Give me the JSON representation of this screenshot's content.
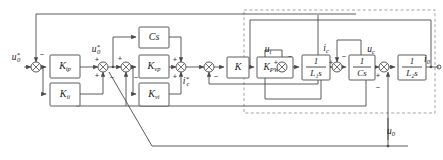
{
  "diagram": {
    "type": "control-block-diagram",
    "colors": {
      "wire": "#4a4a4a",
      "block_stroke": "#4a4a4a",
      "dashed_box": "#9a9a9a",
      "text": "#1a1a1a",
      "background": "#ffffff"
    },
    "blocks": [
      {
        "id": "kip",
        "label": "K",
        "sub": "ip",
        "x": 50,
        "y": 55,
        "w": 30,
        "h": 23
      },
      {
        "id": "kii",
        "label": "K",
        "sub": "ii",
        "x": 50,
        "y": 83,
        "w": 30,
        "h": 23
      },
      {
        "id": "cs",
        "label": "Cs",
        "sub": "",
        "x": 139,
        "y": 27,
        "w": 30,
        "h": 21
      },
      {
        "id": "kvp",
        "label": "K",
        "sub": "vp",
        "x": 139,
        "y": 55,
        "w": 30,
        "h": 23
      },
      {
        "id": "kvi",
        "label": "K",
        "sub": "vi",
        "x": 139,
        "y": 83,
        "w": 30,
        "h": 23
      },
      {
        "id": "k",
        "label": "K",
        "sub": "",
        "x": 227,
        "y": 57,
        "w": 22,
        "h": 21
      },
      {
        "id": "kpwm",
        "label": "K",
        "sub": "PWM",
        "x": 257,
        "y": 57,
        "w": 36,
        "h": 21
      },
      {
        "id": "l1s",
        "label": "1",
        "sub": "L₁s",
        "x": 302,
        "y": 55,
        "w": 28,
        "h": 25
      },
      {
        "id": "cs2",
        "label": "1",
        "sub": "Cs",
        "x": 349,
        "y": 55,
        "w": 26,
        "h": 25
      },
      {
        "id": "l2s",
        "label": "1",
        "sub": "L₂s",
        "x": 398,
        "y": 55,
        "w": 28,
        "h": 25
      }
    ],
    "summing_junctions": [
      {
        "id": "sum1",
        "x": 36,
        "y": 67,
        "signs": [
          {
            "t": "−",
            "x": 41,
            "y": 54
          }
        ]
      },
      {
        "id": "sum2",
        "x": 103,
        "y": 67,
        "signs": [
          {
            "t": "+",
            "x": 97,
            "y": 60
          },
          {
            "t": "+",
            "x": 97,
            "y": 76
          },
          {
            "t": "−",
            "x": 112,
            "y": 78
          }
        ]
      },
      {
        "id": "sum3",
        "x": 126,
        "y": 67,
        "signs": [
          {
            "t": "+",
            "x": 120,
            "y": 59
          },
          {
            "t": "−",
            "x": 133,
            "y": 78
          }
        ]
      },
      {
        "id": "sum4",
        "x": 181,
        "y": 67,
        "signs": [
          {
            "t": "+",
            "x": 175,
            "y": 60
          },
          {
            "t": "+",
            "x": 175,
            "y": 77
          }
        ]
      },
      {
        "id": "sum5",
        "x": 209,
        "y": 67,
        "signs": [
          {
            "t": "−",
            "x": 215,
            "y": 77
          }
        ]
      },
      {
        "id": "sum6",
        "x": 282,
        "y": 67,
        "signs": [
          {
            "t": "+",
            "x": 276,
            "y": 62
          },
          {
            "t": "−",
            "x": 289,
            "y": 58
          }
        ]
      },
      {
        "id": "sum7",
        "x": 337,
        "y": 67,
        "signs": [
          {
            "t": "+",
            "x": 331,
            "y": 62
          },
          {
            "t": "−",
            "x": 343,
            "y": 58
          }
        ]
      },
      {
        "id": "sum8",
        "x": 384,
        "y": 67,
        "signs": [
          {
            "t": "+",
            "x": 378,
            "y": 76
          },
          {
            "t": "−",
            "x": 390,
            "y": 79
          }
        ]
      }
    ],
    "signals": [
      {
        "id": "u0ref_in",
        "label": "u",
        "sup": "*",
        "sub": "0",
        "x": 16,
        "y": 55
      },
      {
        "id": "u0ref_mid",
        "label": "u",
        "sup": "*",
        "sub": "0",
        "x": 101,
        "y": 48
      },
      {
        "id": "ic_ref",
        "label": "i",
        "sup": "*",
        "sub": "c",
        "x": 188,
        "y": 80
      },
      {
        "id": "ui",
        "label": "u",
        "sup": "",
        "sub": "i",
        "x": 271,
        "y": 48
      },
      {
        "id": "ic",
        "label": "i",
        "sup": "",
        "sub": "c",
        "x": 330,
        "y": 47
      },
      {
        "id": "uc",
        "label": "u",
        "sup": "",
        "sub": "c",
        "x": 375,
        "y": 48
      },
      {
        "id": "i0_out",
        "label": "i",
        "sup": "",
        "sub": "0",
        "x": 430,
        "y": 60
      },
      {
        "id": "u0_fb",
        "label": "u",
        "sup": "",
        "sub": "0",
        "x": 388,
        "y": 130
      }
    ],
    "dashed_box": {
      "id": "plant-boundary",
      "x": 244,
      "y": 10,
      "w": 191,
      "h": 103
    }
  }
}
